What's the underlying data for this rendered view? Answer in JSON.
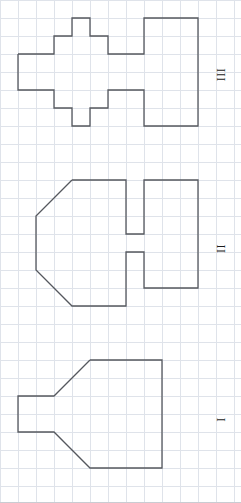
{
  "page": {
    "width": 241,
    "height": 503,
    "background": "#ffffff",
    "border_color": "#c9ccd2"
  },
  "grid": {
    "cell_size": 18,
    "line_color": "#dfe3ea",
    "line_width": 1,
    "visible": true,
    "origin_x": 0,
    "origin_y": 0,
    "columns": 14,
    "rows": 28
  },
  "figures": [
    {
      "id": "figure-III",
      "label": "III",
      "label_orientation": "rotated-90",
      "stroke": "#55585e",
      "stroke_width": 1.3,
      "fill": "none",
      "points": "18,54 54,54 54,36 72,36 72,18 90,18 90,36 108,36 108,54 144,54 144,18 198,18 198,126 144,126 144,90 108,90 108,108 90,108 90,126 72,126 72,108 54,108 54,90 18,90 18,54"
    },
    {
      "id": "figure-II",
      "label": "II",
      "label_orientation": "rotated-90",
      "stroke": "#55585e",
      "stroke_width": 1.3,
      "fill": "none",
      "points": "72,180 126,180 126,234 144,234 144,180 198,180 198,288 144,288 144,252 126,252 126,306 72,306 36,270 36,216 72,180"
    },
    {
      "id": "figure-I",
      "label": "I",
      "label_orientation": "rotated-90",
      "stroke": "#55585e",
      "stroke_width": 1.3,
      "fill": "none",
      "points": "90,360 162,360 162,468 90,468 54,432 18,432 18,396 54,396 90,360"
    }
  ],
  "labels": {
    "figure_three": "III",
    "figure_two": "II",
    "figure_one": "I"
  }
}
